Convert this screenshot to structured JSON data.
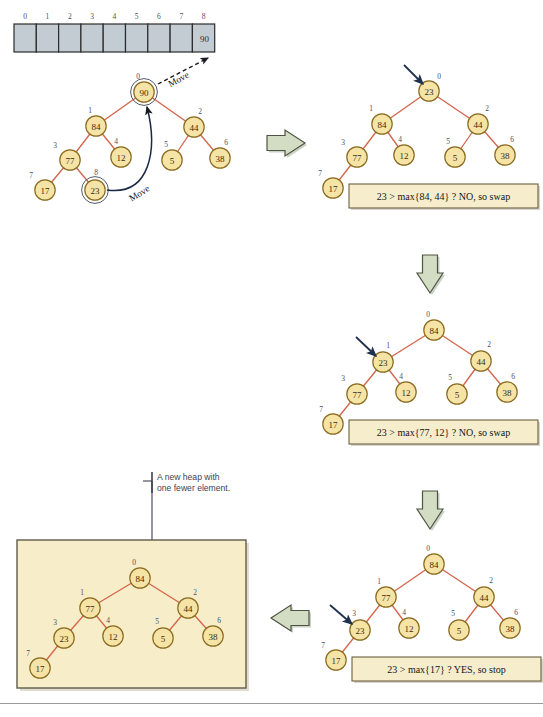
{
  "figure": {
    "colors": {
      "node_fill": "#f6e3a6",
      "node_stroke": "#8a6b1f",
      "edge": "#d4644a",
      "array_cell_fill": "#c2ccd2",
      "array_cell_stroke": "#2b2b2b",
      "green_arrow_fill": "#d3ddc4",
      "green_arrow_stroke": "#4d5442",
      "caption_fill": "#f6edcd",
      "caption_stroke": "#6b6040",
      "panel_fill": "#f7eec9",
      "panel_stroke": "#5e5c4a",
      "pointer_arrow": "#20304f",
      "note_text": "#3d3f55",
      "index_label": "#4a5060"
    },
    "array": {
      "name": "heap-array",
      "indices": [
        "0",
        "1",
        "2",
        "3",
        "4",
        "5",
        "6",
        "7",
        "8"
      ],
      "values": [
        "",
        "",
        "",
        "",
        "",
        "",
        "",
        "",
        "90"
      ]
    },
    "move_labels": {
      "to_array": "Move",
      "to_root": "Move"
    },
    "note": {
      "line1": "A new heap with",
      "line2": "one fewer element."
    },
    "trees": [
      {
        "id": "tree-initial",
        "name": "initial-heap-tree",
        "nodes": [
          {
            "idx": "0",
            "value": "90",
            "x": 144,
            "y": 92,
            "lx": 138,
            "ly": 76,
            "ring": true
          },
          {
            "idx": "1",
            "value": "84",
            "x": 96,
            "y": 126,
            "lx": 90,
            "ly": 110,
            "ring": false
          },
          {
            "idx": "2",
            "value": "44",
            "x": 194,
            "y": 127,
            "lx": 200,
            "ly": 111,
            "ring": false
          },
          {
            "idx": "3",
            "value": "77",
            "x": 70,
            "y": 160,
            "lx": 55,
            "ly": 145,
            "ring": false
          },
          {
            "idx": "4",
            "value": "12",
            "x": 121,
            "y": 157,
            "lx": 116,
            "ly": 141,
            "ring": false
          },
          {
            "idx": "5",
            "value": "5",
            "x": 172,
            "y": 160,
            "lx": 166,
            "ly": 144,
            "ring": false
          },
          {
            "idx": "6",
            "value": "38",
            "x": 220,
            "y": 158,
            "lx": 226,
            "ly": 142,
            "ring": false
          },
          {
            "idx": "7",
            "value": "17",
            "x": 45,
            "y": 190,
            "lx": 31,
            "ly": 175,
            "ring": false
          },
          {
            "idx": "8",
            "value": "23",
            "x": 95,
            "y": 190,
            "lx": 96,
            "ly": 172,
            "ring": true
          }
        ],
        "edges": [
          [
            0,
            1
          ],
          [
            0,
            2
          ],
          [
            1,
            3
          ],
          [
            1,
            4
          ],
          [
            2,
            5
          ],
          [
            2,
            6
          ],
          [
            3,
            7
          ],
          [
            3,
            8
          ]
        ],
        "caption": null,
        "pointer": null
      },
      {
        "id": "tree-step1",
        "name": "heap-tree-step-1",
        "nodes": [
          {
            "idx": "0",
            "value": "23",
            "x": 429,
            "y": 91,
            "lx": 439,
            "ly": 76,
            "ring": false
          },
          {
            "idx": "1",
            "value": "84",
            "x": 382,
            "y": 124,
            "lx": 371,
            "ly": 108,
            "ring": false
          },
          {
            "idx": "2",
            "value": "44",
            "x": 478,
            "y": 124,
            "lx": 487,
            "ly": 108,
            "ring": false
          },
          {
            "idx": "3",
            "value": "77",
            "x": 357,
            "y": 157,
            "lx": 343,
            "ly": 142,
            "ring": false
          },
          {
            "idx": "4",
            "value": "12",
            "x": 404,
            "y": 155,
            "lx": 400,
            "ly": 139,
            "ring": false
          },
          {
            "idx": "5",
            "value": "5",
            "x": 455,
            "y": 157,
            "lx": 448,
            "ly": 141,
            "ring": false
          },
          {
            "idx": "6",
            "value": "38",
            "x": 505,
            "y": 155,
            "lx": 512,
            "ly": 139,
            "ring": false
          },
          {
            "idx": "7",
            "value": "17",
            "x": 333,
            "y": 188,
            "lx": 320,
            "ly": 173,
            "ring": false
          }
        ],
        "edges": [
          [
            0,
            1
          ],
          [
            0,
            2
          ],
          [
            1,
            3
          ],
          [
            1,
            4
          ],
          [
            2,
            5
          ],
          [
            2,
            6
          ],
          [
            3,
            7
          ]
        ],
        "caption": {
          "text": "23 > max{84, 44} ? NO, so swap",
          "x": 349,
          "y": 184,
          "w": 189,
          "h": 24
        },
        "pointer": {
          "x1": 404,
          "y1": 65,
          "x2": 423,
          "y2": 84
        }
      },
      {
        "id": "tree-step2",
        "name": "heap-tree-step-2",
        "nodes": [
          {
            "idx": "0",
            "value": "84",
            "x": 434,
            "y": 330,
            "lx": 428,
            "ly": 314,
            "ring": false
          },
          {
            "idx": "1",
            "value": "23",
            "x": 383,
            "y": 362,
            "lx": 388,
            "ly": 345,
            "ring": false
          },
          {
            "idx": "2",
            "value": "44",
            "x": 481,
            "y": 361,
            "lx": 489,
            "ly": 344,
            "ring": false
          },
          {
            "idx": "3",
            "value": "77",
            "x": 357,
            "y": 394,
            "lx": 343,
            "ly": 378,
            "ring": false
          },
          {
            "idx": "4",
            "value": "12",
            "x": 406,
            "y": 392,
            "lx": 401,
            "ly": 376,
            "ring": false
          },
          {
            "idx": "5",
            "value": "5",
            "x": 457,
            "y": 394,
            "lx": 450,
            "ly": 377,
            "ring": false
          },
          {
            "idx": "6",
            "value": "38",
            "x": 507,
            "y": 392,
            "lx": 513,
            "ly": 376,
            "ring": false
          },
          {
            "idx": "7",
            "value": "17",
            "x": 333,
            "y": 424,
            "lx": 321,
            "ly": 409,
            "ring": false
          }
        ],
        "edges": [
          [
            0,
            1
          ],
          [
            0,
            2
          ],
          [
            1,
            3
          ],
          [
            1,
            4
          ],
          [
            2,
            5
          ],
          [
            2,
            6
          ],
          [
            3,
            7
          ]
        ],
        "caption": {
          "text": "23 > max{77, 12} ? NO, so swap",
          "x": 349,
          "y": 420,
          "w": 189,
          "h": 24
        },
        "pointer": {
          "x1": 356,
          "y1": 337,
          "x2": 376,
          "y2": 356
        }
      },
      {
        "id": "tree-step3",
        "name": "heap-tree-step-3",
        "nodes": [
          {
            "idx": "0",
            "value": "84",
            "x": 434,
            "y": 564,
            "lx": 428,
            "ly": 548,
            "ring": false
          },
          {
            "idx": "1",
            "value": "77",
            "x": 386,
            "y": 597,
            "lx": 379,
            "ly": 581,
            "ring": false
          },
          {
            "idx": "2",
            "value": "44",
            "x": 484,
            "y": 597,
            "lx": 491,
            "ly": 580,
            "ring": false
          },
          {
            "idx": "3",
            "value": "23",
            "x": 360,
            "y": 630,
            "lx": 354,
            "ly": 613,
            "ring": false
          },
          {
            "idx": "4",
            "value": "12",
            "x": 409,
            "y": 628,
            "lx": 404,
            "ly": 612,
            "ring": false
          },
          {
            "idx": "5",
            "value": "5",
            "x": 459,
            "y": 630,
            "lx": 453,
            "ly": 613,
            "ring": false
          },
          {
            "idx": "6",
            "value": "38",
            "x": 510,
            "y": 628,
            "lx": 516,
            "ly": 612,
            "ring": false
          },
          {
            "idx": "7",
            "value": "17",
            "x": 336,
            "y": 660,
            "lx": 323,
            "ly": 645,
            "ring": false
          }
        ],
        "edges": [
          [
            0,
            1
          ],
          [
            0,
            2
          ],
          [
            1,
            3
          ],
          [
            1,
            4
          ],
          [
            2,
            5
          ],
          [
            2,
            6
          ],
          [
            3,
            7
          ]
        ],
        "caption": {
          "text": "23 > max{17} ? YES, so stop",
          "x": 352,
          "y": 657,
          "w": 189,
          "h": 24
        },
        "pointer": {
          "x1": 330,
          "y1": 605,
          "x2": 352,
          "y2": 624
        }
      },
      {
        "id": "tree-result",
        "name": "result-heap-tree",
        "nodes": [
          {
            "idx": "0",
            "value": "84",
            "x": 140,
            "y": 578,
            "lx": 134,
            "ly": 562,
            "ring": false
          },
          {
            "idx": "1",
            "value": "77",
            "x": 90,
            "y": 608,
            "lx": 82,
            "ly": 592,
            "ring": false
          },
          {
            "idx": "2",
            "value": "44",
            "x": 188,
            "y": 608,
            "lx": 195,
            "ly": 592,
            "ring": false
          },
          {
            "idx": "3",
            "value": "23",
            "x": 64,
            "y": 638,
            "lx": 55,
            "ly": 622,
            "ring": false
          },
          {
            "idx": "4",
            "value": "12",
            "x": 113,
            "y": 636,
            "lx": 108,
            "ly": 620,
            "ring": false
          },
          {
            "idx": "5",
            "value": "5",
            "x": 163,
            "y": 638,
            "lx": 157,
            "ly": 621,
            "ring": false
          },
          {
            "idx": "6",
            "value": "38",
            "x": 213,
            "y": 636,
            "lx": 219,
            "ly": 620,
            "ring": false
          },
          {
            "idx": "7",
            "value": "17",
            "x": 40,
            "y": 668,
            "lx": 28,
            "ly": 653,
            "ring": false
          }
        ],
        "edges": [
          [
            0,
            1
          ],
          [
            0,
            2
          ],
          [
            1,
            3
          ],
          [
            1,
            4
          ],
          [
            2,
            5
          ],
          [
            2,
            6
          ],
          [
            3,
            7
          ]
        ],
        "caption": null,
        "pointer": null
      }
    ]
  }
}
